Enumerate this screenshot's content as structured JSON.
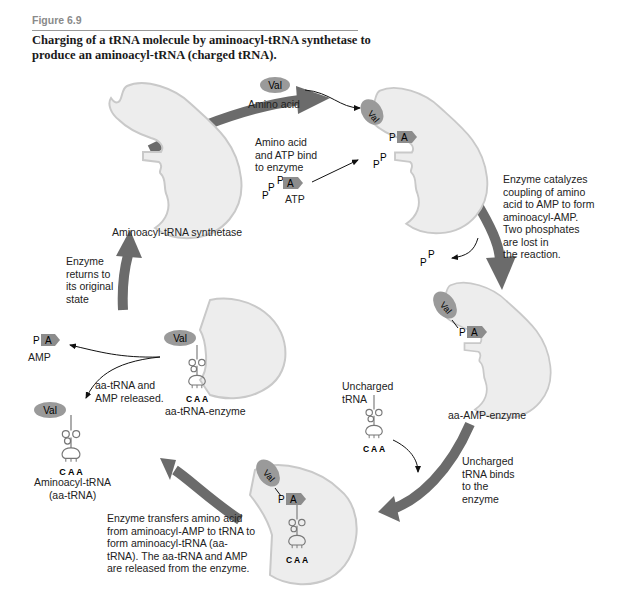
{
  "figure": {
    "label": "Figure 6.9",
    "caption": "Charging of a tRNA molecule by aminoacyl-tRNA synthetase to produce an aminoacyl-tRNA (charged tRNA)."
  },
  "colors": {
    "cycle_arrow": "#6b6b6b",
    "enzyme_fill": "#ededed",
    "enzyme_stroke": "#c9c9c9",
    "val_fill": "#9a9a9a",
    "atp_fill": "#8c8c8c",
    "phosphate_fill": "#e0e0e0"
  },
  "molecules": {
    "val": "Val",
    "phosphate": "P",
    "adenosine": "A",
    "anticodon": "C A A"
  },
  "states": {
    "enzyme": "Aminoacyl-tRNA synthetase",
    "aa_amp_enzyme": "aa-AMP-enzyme",
    "aa_trna_enzyme": "aa-tRNA-enzyme"
  },
  "labels": {
    "amino_acid": "Amino acid",
    "atp": "ATP",
    "amp": "AMP",
    "uncharged_trna": "Uncharged\ntRNA",
    "aminoacyl_trna": "Aminoacyl-tRNA\n(aa-tRNA)"
  },
  "steps": {
    "bind": "Amino acid\nand ATP bind\nto enzyme",
    "catalyze": "Enzyme catalyzes\ncoupling of amino\nacid to AMP to form\naminoacyl-AMP.\nTwo phosphates\nare lost in\nthe reaction.",
    "trna_binds": "Uncharged\ntRNA binds\nto the\nenzyme",
    "transfer": "Enzyme transfers amino acid\nfrom aminoacyl-AMP to tRNA to\nform aminoacyl-tRNA (aa-\ntRNA). The aa-tRNA and AMP\nare released from the enzyme.",
    "release": "aa-tRNA and\nAMP released.",
    "return": "Enzyme\nreturns to\nits original\nstate"
  }
}
